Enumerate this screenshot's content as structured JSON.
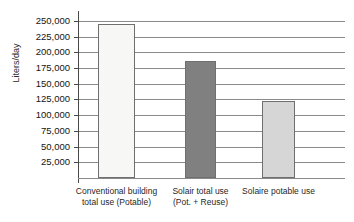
{
  "chart_data": {
    "type": "bar",
    "title": "",
    "subtitle": "",
    "xlabel": "",
    "ylabel": "Liters/day",
    "ylim": [
      0,
      262500
    ],
    "grid": true,
    "legend": "none",
    "categories": [
      "Conventional building total use (Potable)",
      "Solair total use (Pot. + Reuse)",
      "Solaire potable use"
    ],
    "category_lines": [
      [
        "Conventional building",
        "total use (Potable)"
      ],
      [
        "Solair total use",
        "(Pot. +  Reuse)"
      ],
      [
        "Solaire potable use",
        ""
      ]
    ],
    "values": [
      245000,
      186000,
      123000
    ],
    "bar_colors": [
      "#f7f7f5",
      "#808080",
      "#d6d6d6"
    ],
    "tick_values": [
      250000,
      225000,
      200000,
      175000,
      150000,
      125000,
      100000,
      75000,
      50000,
      25000
    ],
    "tick_labels": [
      "250,000",
      "225,000",
      "200,000",
      "175,000",
      "150,000",
      "125,000",
      "100,000",
      "75,000",
      "50,000",
      "25,000"
    ],
    "axis_color": "#8a8a8a"
  }
}
